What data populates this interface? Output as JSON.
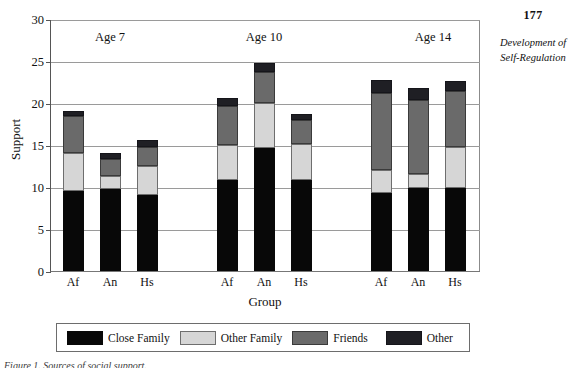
{
  "page": {
    "number": "177",
    "running_head": "Development of Self-Regulation"
  },
  "caption": {
    "text": "Figure 1. Sources of social support."
  },
  "chart_data": {
    "type": "bar",
    "stacked": true,
    "title": "",
    "xlabel": "Group",
    "ylabel": "Support",
    "ylim": [
      0,
      30
    ],
    "yticks": [
      0,
      5,
      10,
      15,
      20,
      25,
      30
    ],
    "grid": true,
    "legend_position": "bottom",
    "group_titles": [
      "Age 7",
      "Age 10",
      "Age 14"
    ],
    "categories": [
      "Af",
      "An",
      "Hs",
      "Af",
      "An",
      "Hs",
      "Af",
      "An",
      "Hs"
    ],
    "groups": [
      {
        "name": "Age 7",
        "categories": [
          "Af",
          "An",
          "Hs"
        ],
        "totals": [
          19.1,
          14.1,
          15.6
        ]
      },
      {
        "name": "Age 10",
        "categories": [
          "Af",
          "An",
          "Hs"
        ],
        "totals": [
          20.6,
          24.8,
          18.7
        ]
      },
      {
        "name": "Age 14",
        "categories": [
          "Af",
          "An",
          "Hs"
        ],
        "totals": [
          22.7,
          21.8,
          22.6
        ]
      }
    ],
    "series": [
      {
        "name": "Close Family",
        "color": "#080808",
        "values": [
          9.5,
          9.8,
          9.1,
          10.8,
          14.7,
          10.8,
          9.3,
          9.9,
          9.9
        ]
      },
      {
        "name": "Other Family",
        "color": "#d6d6d6",
        "values": [
          4.5,
          1.5,
          3.4,
          4.2,
          5.3,
          4.3,
          2.7,
          1.7,
          4.9
        ]
      },
      {
        "name": "Friends",
        "color": "#6a6a6a",
        "values": [
          4.5,
          2.0,
          2.3,
          4.7,
          3.7,
          2.9,
          9.2,
          8.7,
          6.6
        ]
      },
      {
        "name": "Other",
        "color": "#1f1f24",
        "values": [
          0.6,
          0.8,
          0.8,
          0.9,
          1.1,
          0.7,
          1.5,
          1.5,
          1.2
        ]
      }
    ]
  }
}
